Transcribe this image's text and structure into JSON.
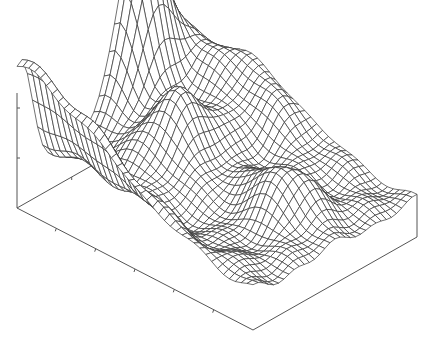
{
  "chart_data": {
    "type": "surface",
    "style": "wireframe",
    "title": "",
    "xlabel": "",
    "ylabel": "",
    "zlabel": "",
    "grid": false,
    "legend": null,
    "line_color": "#333333",
    "axis_color": "#555555",
    "mesh": {
      "nx": 40,
      "ny": 32
    },
    "domain": {
      "x": [
        0,
        1
      ],
      "y": [
        0,
        1
      ],
      "z": [
        0,
        1
      ]
    },
    "z_ticks_count": 2,
    "x_ticks_count": 6,
    "y_ticks_count": 2,
    "box": {
      "origin_back_left": [
        17,
        208
      ],
      "front": [
        253,
        330
      ],
      "right": [
        417,
        237
      ],
      "z_height_px": 115
    },
    "surface_features": [
      {
        "name": "main-peak",
        "x": 0.02,
        "y": 0.72,
        "height": 1.55,
        "sx": 0.1,
        "sy": 0.16
      },
      {
        "name": "back-left-ridge",
        "x": 0.0,
        "y": 0.02,
        "height": 0.95,
        "sx": 0.55,
        "sy": 0.1
      },
      {
        "name": "central-hump",
        "x": 0.3,
        "y": 0.55,
        "height": 0.55,
        "sx": 0.14,
        "sy": 0.18
      },
      {
        "name": "right-plateau",
        "x": 0.25,
        "y": 0.95,
        "height": 0.55,
        "sx": 0.35,
        "sy": 0.18
      },
      {
        "name": "front-hill",
        "x": 0.75,
        "y": 0.55,
        "height": 0.4,
        "sx": 0.15,
        "sy": 0.14
      },
      {
        "name": "front-valley",
        "x": 0.6,
        "y": 0.3,
        "height": -0.1,
        "sx": 0.15,
        "sy": 0.15
      },
      {
        "name": "base-level",
        "x": 0.5,
        "y": 0.5,
        "height": 0.32,
        "sx": 10,
        "sy": 10
      }
    ]
  }
}
